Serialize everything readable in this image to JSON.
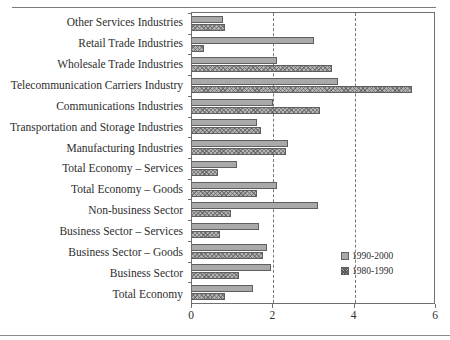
{
  "chart_data": {
    "type": "bar",
    "orientation": "horizontal",
    "title": "",
    "xlabel": "",
    "ylabel": "",
    "xlim": [
      0,
      6
    ],
    "xticks": [
      0,
      2,
      4,
      6
    ],
    "xtick_labels": [
      "0",
      "2",
      "4",
      "6"
    ],
    "grid": "vertical-dashed",
    "legend_position": "inside-bottom-right",
    "categories": [
      "Other Services Industries",
      "Retail Trade Industries",
      "Wholesale Trade Industries",
      "Telecommunication Carriers Industry",
      "Communications Industries",
      "Transportation and Storage Industries",
      "Manufacturing Industries",
      "Total Economy – Services",
      "Total Economy – Goods",
      "Non-business Sector",
      "Business Sector – Services",
      "Business Sector – Goods",
      "Business Sector",
      "Total Economy"
    ],
    "series": [
      {
        "name": "1990-2000",
        "style": "solid-gray",
        "values": [
          0.75,
          3.0,
          2.1,
          3.6,
          2.0,
          1.6,
          2.35,
          1.1,
          2.1,
          3.1,
          1.65,
          1.85,
          1.95,
          1.5
        ]
      },
      {
        "name": "1980-1990",
        "style": "hatched",
        "values": [
          0.8,
          0.3,
          3.45,
          5.4,
          3.15,
          1.7,
          2.3,
          0.65,
          1.6,
          0.95,
          0.7,
          1.75,
          1.15,
          0.8
        ]
      }
    ]
  },
  "legend": {
    "items": [
      {
        "label": "1990-2000"
      },
      {
        "label": "1980-1990"
      }
    ]
  },
  "colors": {
    "series1": "#a9a9a9",
    "series2": "#b4b4b4",
    "axis": "#6e6e6e",
    "grid": "#777777",
    "text": "#2e2e2e"
  },
  "caption_fragment": ""
}
